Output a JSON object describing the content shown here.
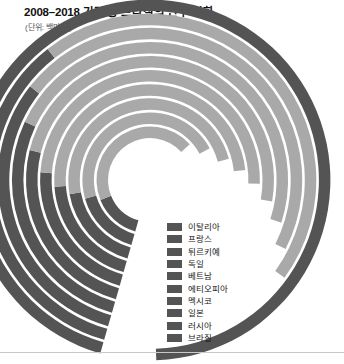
{
  "header": {
    "title": "2008–2018 기간 중 브라질의 인구 변화",
    "subtitle": "(단위: 백만 명)"
  },
  "colors": {
    "arc_light": "#a9a9a9",
    "arc_dark": "#545454",
    "legend_swatch": "#545454",
    "gap": "#ffffff",
    "background": "#ffffff",
    "title_text": "#111111",
    "subtitle_text": "#555555"
  },
  "legend": {
    "items": [
      {
        "label": "이탈리아",
        "color": "#545454"
      },
      {
        "label": "프랑스",
        "color": "#545454"
      },
      {
        "label": "튀르키예",
        "color": "#545454"
      },
      {
        "label": "독일",
        "color": "#545454"
      },
      {
        "label": "베트남",
        "color": "#545454"
      },
      {
        "label": "에티오피아",
        "color": "#545454"
      },
      {
        "label": "멕시코",
        "color": "#545454"
      },
      {
        "label": "일본",
        "color": "#545454"
      },
      {
        "label": "러시아",
        "color": "#545454"
      },
      {
        "label": "브라질",
        "color": "#545454"
      }
    ]
  },
  "chart_data": {
    "type": "pie",
    "subtype": "radial-nested-donut",
    "title": "2008–2018 기간 중 브라질의 인구 변화",
    "subtitle": "(단위: 백만 명)",
    "unit": "백만 명",
    "xlabel": "",
    "ylabel": "",
    "grid": false,
    "legend_position": "bottom-right",
    "center": {
      "x": 150,
      "y": 180
    },
    "inner_radius": 42,
    "ring_thickness": 11.5,
    "ring_gap": 2.6,
    "start_angle_deg": 196,
    "direction": "clockwise",
    "categories": [
      "이탈리아",
      "프랑스",
      "튀르키예",
      "독일",
      "베트남",
      "에티오피아",
      "멕시코",
      "일본",
      "러시아",
      "브라질"
    ],
    "values": [
      59,
      65,
      85,
      83,
      97,
      117,
      127,
      126,
      144,
      210
    ],
    "rings": [
      {
        "name": "이탈리아",
        "ring_index": 0,
        "value": 59,
        "sweep_deg": 212,
        "dark_sweep_deg": 52
      },
      {
        "name": "프랑스",
        "ring_index": 1,
        "value": 65,
        "sweep_deg": 226,
        "dark_sweep_deg": 58
      },
      {
        "name": "튀르키예",
        "ring_index": 2,
        "value": 85,
        "sweep_deg": 239,
        "dark_sweep_deg": 64
      },
      {
        "name": "독일",
        "ring_index": 3,
        "value": 83,
        "sweep_deg": 248,
        "dark_sweep_deg": 70
      },
      {
        "name": "베트남",
        "ring_index": 4,
        "value": 97,
        "sweep_deg": 256,
        "dark_sweep_deg": 78
      },
      {
        "name": "에티오피아",
        "ring_index": 5,
        "value": 117,
        "sweep_deg": 264,
        "dark_sweep_deg": 88
      },
      {
        "name": "멕시코",
        "ring_index": 6,
        "value": 127,
        "sweep_deg": 272,
        "dark_sweep_deg": 99
      },
      {
        "name": "일본",
        "ring_index": 7,
        "value": 126,
        "sweep_deg": 281,
        "dark_sweep_deg": 112
      },
      {
        "name": "러시아",
        "ring_index": 8,
        "value": 144,
        "sweep_deg": 290,
        "dark_sweep_deg": 126
      },
      {
        "name": "브라질",
        "ring_index": 9,
        "value": 210,
        "sweep_deg": 342,
        "dark_sweep_deg": 342
      }
    ]
  }
}
